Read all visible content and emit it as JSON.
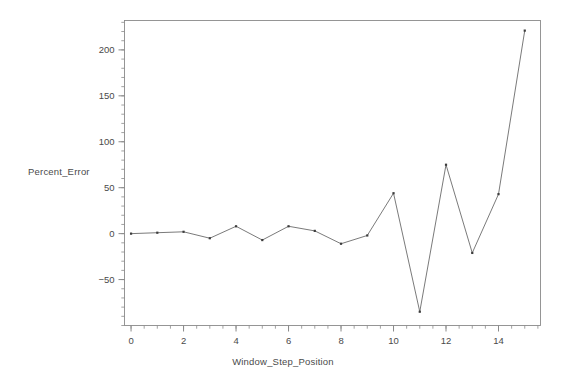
{
  "chart_data": {
    "type": "line",
    "title": "",
    "subtitle": "",
    "xlabel": "Window_Step_Position",
    "ylabel": "Percent_Error",
    "x": [
      0,
      1,
      2,
      3,
      4,
      5,
      6,
      7,
      8,
      9,
      10,
      11,
      12,
      13,
      14,
      15
    ],
    "values": [
      0,
      1,
      2,
      -5,
      8,
      -7,
      8,
      3,
      -11,
      -2,
      44,
      -85,
      75,
      -21,
      43,
      221
    ],
    "series": [
      {
        "name": "Percent_Error",
        "values": [
          0,
          1,
          2,
          -5,
          8,
          -7,
          8,
          3,
          -11,
          -2,
          44,
          -85,
          75,
          -21,
          43,
          221
        ]
      }
    ],
    "xlim": [
      -0.25,
      15.6
    ],
    "ylim": [
      -100,
      232
    ],
    "xticks": [
      0,
      2,
      4,
      6,
      8,
      10,
      12,
      14
    ],
    "xtick_labels": [
      "0",
      "2",
      "4",
      "6",
      "8",
      "10",
      "12",
      "14"
    ],
    "yticks": [
      -50,
      0,
      50,
      100,
      150,
      200
    ],
    "ytick_labels": [
      "−50",
      "0",
      "50",
      "100",
      "150",
      "200"
    ],
    "minor_xtick_step": 0.5,
    "minor_ytick_step": 10,
    "grid": false,
    "legend": false,
    "legend_position": "none",
    "marker": "point",
    "line_color": "#6b6b6b",
    "marker_color": "#3c3c3c",
    "axis_color": "#8a8a8a",
    "background_color": "#ffffff"
  }
}
